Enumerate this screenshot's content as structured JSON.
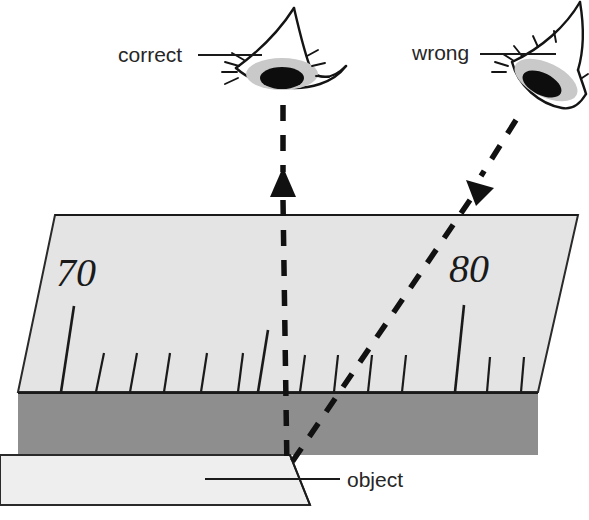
{
  "diagram": {
    "labels": {
      "correct": "correct",
      "wrong": "wrong",
      "object": "object"
    },
    "scale": {
      "major_values": [
        "70",
        "80"
      ],
      "left_number": "70",
      "right_number": "80"
    },
    "colors": {
      "background": "#ffffff",
      "ruler_face": "#e4e4e4",
      "ruler_band": "#8e8e8e",
      "object_body": "#eeeeee",
      "ink": "#141414",
      "iris": "#c9c9c9",
      "pupil": "#0d0d0d"
    },
    "icons": {
      "left_eye": "eye-looking-down-icon",
      "right_eye": "eye-looking-down-left-icon",
      "correct_sightline": "vertical-dashed-arrow-icon",
      "wrong_sightline": "slanted-dashed-arrow-icon"
    }
  }
}
